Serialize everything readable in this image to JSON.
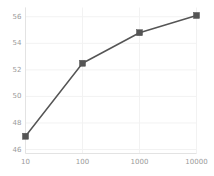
{
  "chart_data": {
    "type": "line",
    "title": "",
    "subtitle": "",
    "xlabel": "",
    "ylabel": "",
    "xscale": "log",
    "yscale": "linear",
    "x": [
      10,
      100,
      1000,
      10000
    ],
    "values": [
      47.0,
      52.5,
      54.8,
      56.1
    ],
    "series": [
      {
        "name": "",
        "x": [
          10,
          100,
          1000,
          10000
        ],
        "values": [
          47.0,
          52.5,
          54.8,
          56.1
        ],
        "color": "#555555",
        "marker": "square",
        "linewidth": 1.5
      }
    ],
    "xlim": [
      10,
      10000
    ],
    "ylim": [
      45.7,
      56.7
    ],
    "xticks": [
      10,
      100,
      1000,
      10000
    ],
    "xtick_labels": [
      "10",
      "100",
      "1000",
      "10000"
    ],
    "yticks": [
      46,
      48,
      50,
      52,
      54,
      56
    ],
    "ytick_labels": [
      "46",
      "48",
      "50",
      "52",
      "54",
      "56"
    ],
    "grid": true,
    "grid_axis": "y",
    "grid_color": "#f2f2f2",
    "legend": false,
    "legend_position": "none",
    "annotations": [],
    "spine_color": "#e3e3e3",
    "tick_label_color": "#9a9a9a",
    "background": "#ffffff"
  }
}
